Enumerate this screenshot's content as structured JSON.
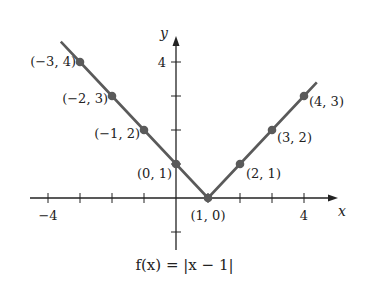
{
  "chart_data": {
    "type": "line",
    "title": "f(x) = |x − 1|",
    "xlabel": "x",
    "ylabel": "y",
    "x": [
      -3.6,
      -3,
      -2,
      -1,
      0,
      1,
      2,
      3,
      4,
      4.4
    ],
    "series": [
      {
        "name": "f(x) = |x − 1|",
        "values": [
          4.6,
          4,
          3,
          2,
          1,
          0,
          1,
          2,
          3,
          3.4
        ],
        "color": "#5a5a5a"
      }
    ],
    "points": [
      {
        "x": -3,
        "y": 4,
        "label": "(−3, 4)"
      },
      {
        "x": -2,
        "y": 3,
        "label": "(−2, 3)"
      },
      {
        "x": -1,
        "y": 2,
        "label": "(−1, 2)"
      },
      {
        "x": 0,
        "y": 1,
        "label": "(0, 1)"
      },
      {
        "x": 1,
        "y": 0,
        "label": "(1, 0)"
      },
      {
        "x": 2,
        "y": 1,
        "label": "(2, 1)"
      },
      {
        "x": 3,
        "y": 2,
        "label": "(3, 2)"
      },
      {
        "x": 4,
        "y": 3,
        "label": "(4, 3)"
      }
    ],
    "xticks": [
      -4,
      -3,
      -2,
      -1,
      1,
      2,
      3,
      4
    ],
    "xtick_labels": {
      "-4": "−4",
      "4": "4"
    },
    "yticks": [
      -1,
      1,
      2,
      3,
      4
    ],
    "ytick_labels": {
      "4": "4"
    },
    "xlim": [
      -4.5,
      4.8
    ],
    "ylim": [
      -1.4,
      5
    ],
    "grid": false,
    "legend": "none"
  },
  "caption": "f(x) = |x − 1|",
  "colors": {
    "axis": "#222222",
    "line": "#5a5a5a",
    "point": "#5a5a5a"
  }
}
